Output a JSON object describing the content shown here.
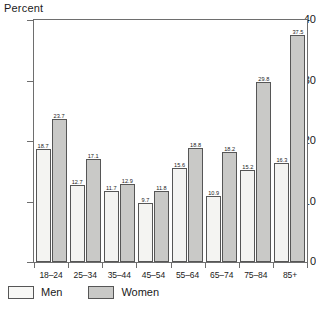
{
  "chart_data": {
    "type": "bar",
    "title": "",
    "xlabel": "",
    "ylabel": "Percent",
    "ylim": [
      0,
      40
    ],
    "yticks": [
      "0",
      "10",
      "20",
      "30",
      "40"
    ],
    "grid": false,
    "legend_position": "bottom-left",
    "categories": [
      "18–24",
      "25–34",
      "35–44",
      "45–54",
      "55–64",
      "65–74",
      "75–84",
      "85+"
    ],
    "series": [
      {
        "name": "Men",
        "color": "#f4f4f2",
        "values": [
          18.7,
          12.7,
          11.7,
          9.7,
          15.6,
          10.9,
          15.2,
          16.3
        ],
        "labels": [
          "18.7",
          "12.7",
          "11.7",
          "9.7",
          "15.6",
          "10.9",
          "15.2",
          "16.3"
        ]
      },
      {
        "name": "Women",
        "color": "#c9c9c7",
        "values": [
          23.7,
          17.1,
          12.9,
          11.8,
          18.8,
          18.2,
          29.8,
          37.5
        ],
        "labels": [
          "23.7",
          "17.1",
          "12.9",
          "11.8",
          "18.8",
          "18.2",
          "29.8",
          "37.5"
        ]
      }
    ]
  },
  "legend": {
    "items": [
      {
        "label": "Men"
      },
      {
        "label": "Women"
      }
    ]
  }
}
